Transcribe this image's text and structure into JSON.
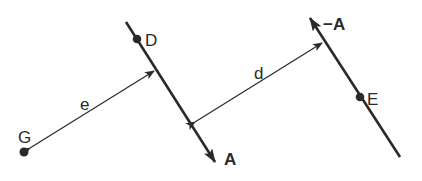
{
  "diagram": {
    "points": {
      "D": {
        "label": "D"
      },
      "E": {
        "label": "E"
      },
      "G": {
        "label": "G"
      }
    },
    "lines": {
      "line_A": {
        "direction_label": "A"
      },
      "line_minus_A": {
        "direction_label": "−A"
      }
    },
    "distances": {
      "d": {
        "label": "d"
      },
      "e": {
        "label": "e"
      }
    },
    "colors": {
      "stroke": "#2a2a2a",
      "background": "#ffffff"
    }
  }
}
